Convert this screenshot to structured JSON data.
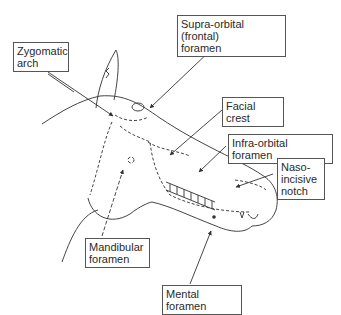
{
  "diagram": {
    "labels": [
      {
        "id": "zygomatic-arch",
        "text": "Zygomatic\narch"
      },
      {
        "id": "supra-orbital-foramen",
        "text": "Supra-orbital (frontal)\nforamen"
      },
      {
        "id": "facial-crest",
        "text": "Facial crest"
      },
      {
        "id": "infra-orbital-foramen",
        "text": "Infra-orbital foramen"
      },
      {
        "id": "naso-incisive-notch",
        "text": "Naso-\nincisive\nnotch"
      },
      {
        "id": "mandibular-foramen",
        "text": "Mandibular\nforamen"
      },
      {
        "id": "mental-foramen",
        "text": "Mental foramen"
      }
    ]
  }
}
